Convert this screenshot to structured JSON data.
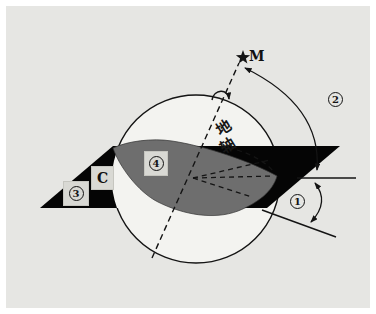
{
  "diagram": {
    "labels": {
      "star": "M",
      "axis_char_1": "地",
      "axis_char_2": "轴",
      "axis_full": "地轴",
      "horizon_letter": "C",
      "angle_1": "1",
      "angle_2": "2",
      "num_3": "3",
      "num_4": "4"
    },
    "colors": {
      "panel_background": "#e6e6e3",
      "sphere_fill": "#f3f3f0",
      "equator_fill": "#6e6e6e",
      "horizon_fill": "#050505",
      "line": "#141414",
      "label_box": "#d9d9d4"
    }
  }
}
